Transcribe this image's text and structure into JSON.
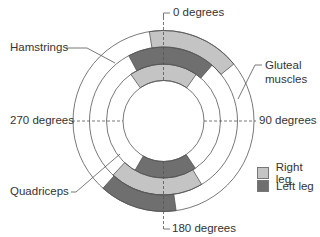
{
  "diagram": {
    "title": "",
    "angle_labels": {
      "top": "0 degrees",
      "right": "90 degrees",
      "bottom": "180 degrees",
      "left": "270 degrees"
    },
    "muscle_labels": {
      "hamstrings": "Hamstrings",
      "gluteal": "Gluteal\nmuscles",
      "gluteal_line1": "Gluteal",
      "gluteal_line2": "muscles",
      "quadriceps": "Quadriceps"
    },
    "legend": [
      {
        "label": "Right leg",
        "color": "#c4c4c4"
      },
      {
        "label": "Left leg",
        "color": "#6f6f6f"
      }
    ],
    "rings": [
      {
        "name": "Hamstrings",
        "position": "inner",
        "segments": [
          {
            "leg": "Right leg",
            "start_deg": -35,
            "end_deg": 35
          },
          {
            "leg": "Left leg",
            "start_deg": 146,
            "end_deg": 210
          }
        ]
      },
      {
        "name": "Quadriceps",
        "position": "middle",
        "segments": [
          {
            "leg": "Left leg",
            "start_deg": -28,
            "end_deg": 41
          },
          {
            "leg": "Right leg",
            "start_deg": 149,
            "end_deg": 223
          }
        ]
      },
      {
        "name": "Gluteal muscles",
        "position": "outer",
        "segments": [
          {
            "leg": "Right leg",
            "start_deg": -9,
            "end_deg": 51
          },
          {
            "leg": "Left leg",
            "start_deg": 172,
            "end_deg": 222
          }
        ]
      }
    ],
    "colors": {
      "right_leg": "#c4c4c4",
      "left_leg": "#6f6f6f",
      "ring_stroke": "#555555",
      "dash": "#555555"
    }
  }
}
